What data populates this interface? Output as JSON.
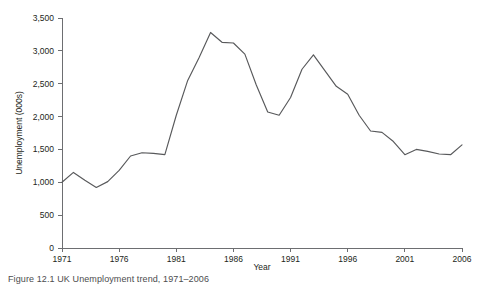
{
  "figure": {
    "caption": "Figure 12.1 UK Unemployment trend, 1971–2006"
  },
  "axis": {
    "y_title": "Unemployment (000s)",
    "x_title": "Year",
    "y_ticks": [
      "0",
      "500",
      "1,000",
      "1,500",
      "2,000",
      "2,500",
      "3,000",
      "3,500"
    ],
    "x_ticks": [
      "1971",
      "1976",
      "1981",
      "1986",
      "1991",
      "1996",
      "2001",
      "2006"
    ]
  },
  "colors": {
    "line": "#58595b",
    "axis": "#6d6e71",
    "text": "#231f20",
    "background": "#ffffff"
  },
  "chart_data": {
    "type": "line",
    "title": "",
    "xlabel": "Year",
    "ylabel": "Unemployment (000s)",
    "xlim": [
      1971,
      2006
    ],
    "ylim": [
      0,
      3500
    ],
    "grid": false,
    "legend": "none",
    "x_tick_labels": [
      "1971",
      "1976",
      "1981",
      "1986",
      "1991",
      "1996",
      "2001",
      "2006"
    ],
    "y_tick_labels": [
      "0",
      "500",
      "1,000",
      "1,500",
      "2,000",
      "2,500",
      "3,000",
      "3,500"
    ],
    "x": [
      1971,
      1972,
      1973,
      1974,
      1975,
      1976,
      1977,
      1978,
      1979,
      1980,
      1981,
      1982,
      1983,
      1984,
      1985,
      1986,
      1987,
      1988,
      1989,
      1990,
      1991,
      1992,
      1993,
      1994,
      1995,
      1996,
      1997,
      1998,
      1999,
      2000,
      2001,
      2002,
      2003,
      2004,
      2005,
      2006
    ],
    "series": [
      {
        "name": "Unemployment (000s)",
        "values": [
          1000,
          1150,
          1030,
          920,
          1010,
          1180,
          1400,
          1450,
          1440,
          1420,
          2020,
          2550,
          2900,
          3280,
          3130,
          3120,
          2950,
          2480,
          2070,
          2020,
          2290,
          2720,
          2940,
          2700,
          2460,
          2340,
          2020,
          1780,
          1760,
          1620,
          1420,
          1500,
          1470,
          1430,
          1420,
          1570
        ]
      }
    ]
  }
}
